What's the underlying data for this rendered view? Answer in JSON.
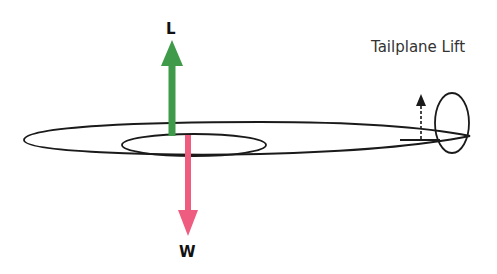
{
  "diagram": {
    "labels": {
      "lift": "L",
      "weight": "W",
      "tailplane_lift": "Tailplane Lift"
    },
    "colors": {
      "lift_arrow": "#3f9a4a",
      "weight_arrow": "#ee5c80",
      "outline": "#1a1a1a"
    }
  }
}
